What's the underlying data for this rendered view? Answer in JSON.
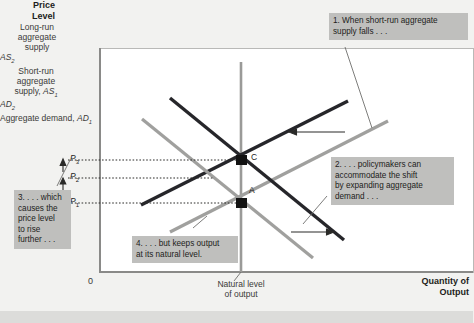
{
  "figure": {
    "axes": {
      "y_axis_label_line1": "Price",
      "y_axis_label_line2": "Level",
      "x_axis_label_line1": "Quantity of",
      "x_axis_label_line2": "Output",
      "origin_label": "0",
      "x_tick_note_line1": "Natural level",
      "x_tick_note_line2": "of output"
    },
    "price_levels": [
      {
        "id": "P3",
        "label": "P",
        "sub": "3"
      },
      {
        "id": "P2",
        "label": "P",
        "sub": "2"
      },
      {
        "id": "P1",
        "label": "P",
        "sub": "1"
      }
    ],
    "equilibrium_points": [
      {
        "name": "C",
        "label": "C"
      },
      {
        "name": "A",
        "label": "A"
      }
    ],
    "curves": [
      {
        "id": "lras",
        "label_lines": [
          "Long-run",
          "aggregate",
          "supply"
        ],
        "color": "#9a9a98"
      },
      {
        "id": "as2",
        "label_plain": "AS",
        "label_sub": "2",
        "color": "#26262a"
      },
      {
        "id": "as1",
        "label_lines": [
          "Short-run",
          "aggregate"
        ],
        "label_last_plain": "supply, ",
        "label_last_italic": "AS",
        "label_last_sub": "1",
        "color": "#a0a09e"
      },
      {
        "id": "ad2",
        "label_plain": "AD",
        "label_sub": "2",
        "color": "#26262a"
      },
      {
        "id": "ad1",
        "label_plain": "Aggregate demand, ",
        "label_italic": "AD",
        "label_sub": "1",
        "color": "#a0a09e"
      }
    ],
    "callouts": [
      {
        "id": "callout-1",
        "lines": [
          "1. When short-run aggregate",
          "supply falls . . ."
        ]
      },
      {
        "id": "callout-2",
        "lines": [
          "2. . . . policymakers can",
          "accommodate the shift",
          "by expanding aggregate",
          "demand . . ."
        ]
      },
      {
        "id": "callout-3",
        "lines": [
          "3. . . . which",
          "causes the",
          "price level",
          "to rise",
          "further . . ."
        ]
      },
      {
        "id": "callout-4",
        "lines": [
          "4. . . . but keeps output",
          "at its natural level."
        ]
      }
    ],
    "colors": {
      "panel_background": "#ffffff",
      "page_background": "#f2f2f0",
      "callout_background": "#bfbfbd",
      "dark_curve": "#26262a",
      "light_curve": "#a0a09e",
      "axis": "#8a8a88",
      "bottom_band": "#dcdcda"
    }
  }
}
